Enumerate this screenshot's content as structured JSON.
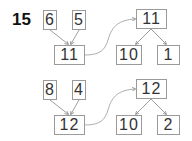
{
  "problem_number": "15",
  "groups": [
    {
      "parts": [
        "6",
        "5"
      ],
      "sum": "11",
      "decomposition": {
        "whole": "11",
        "parts": [
          "10",
          "1"
        ]
      }
    },
    {
      "parts": [
        "8",
        "4"
      ],
      "sum": "12",
      "decomposition": {
        "whole": "12",
        "parts": [
          "10",
          "2"
        ]
      }
    }
  ]
}
